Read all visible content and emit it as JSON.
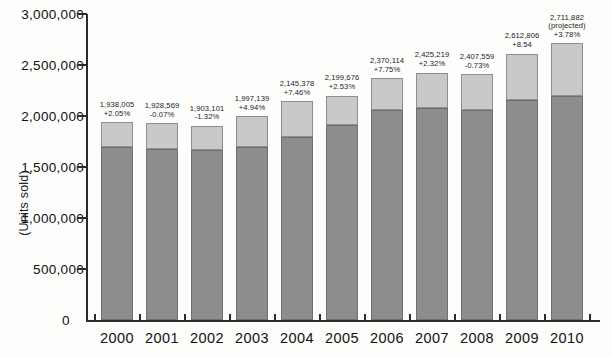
{
  "chart_data": {
    "type": "bar",
    "stacked": true,
    "title": "",
    "subtitle": "",
    "xlabel": "",
    "ylabel": "(Units sold)",
    "ylim": [
      0,
      3000000
    ],
    "ytick_labels": [
      "3,000,000",
      "2,500,000",
      "2,000,000",
      "1,500,000",
      "1,000,000",
      "500,000",
      "0"
    ],
    "ytick_values": [
      3000000,
      2500000,
      2000000,
      1500000,
      1000000,
      500000,
      0
    ],
    "grid": false,
    "legend": "none",
    "categories": [
      "2000",
      "2001",
      "2002",
      "2003",
      "2004",
      "2005",
      "2006",
      "2007",
      "2008",
      "2009",
      "2010"
    ],
    "series": [
      {
        "name": "lower-segment",
        "color": "#8d8d8d",
        "values": [
          1700000,
          1680000,
          1665000,
          1700000,
          1790000,
          1915000,
          2055000,
          2075000,
          2060000,
          2160000,
          2195000
        ]
      },
      {
        "name": "upper-segment",
        "color": "#c9c9c9",
        "values": [
          238005,
          248569,
          238101,
          297139,
          355378,
          284676,
          315114,
          350219,
          347559,
          452806,
          516882
        ]
      }
    ],
    "totals": [
      1938005,
      1928569,
      1903101,
      1997139,
      2145378,
      2199676,
      2370114,
      2425219,
      2407559,
      2612806,
      2711882
    ],
    "bar_labels": [
      "1,938,005\n+2.05%",
      "1,928,569\n-0.07%",
      "1,903,101\n-1.32%",
      "1,997,139\n+4.94%",
      "2,145,378\n+7.46%",
      "2,199,676\n+2.53%",
      "2,370,114\n+7.75%",
      "2,425,219\n+2.32%",
      "2,407,559\n-0.73%",
      "2,612,806\n+8.54",
      "2,711,882\n(projected)\n+3.78%"
    ],
    "annotations": [
      {
        "category": "2010",
        "text": "(projected)"
      }
    ],
    "colors": {
      "background": "#fdfdfb",
      "axis": "#2b2b2b",
      "lower_segment": "#8d8d8d",
      "upper_segment": "#c9c9c9",
      "text": "#1a1a1a"
    }
  }
}
